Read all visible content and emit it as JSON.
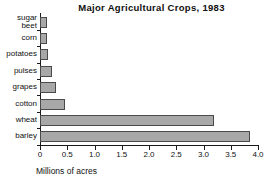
{
  "chart_data": {
    "type": "bar",
    "orientation": "horizontal",
    "title": "Major Agricultural Crops, 1983",
    "xlabel": "Millions of acres",
    "ylabel": "",
    "categories": [
      "sugar\nbeet",
      "corn",
      "potatoes",
      "pulses",
      "grapes",
      "cotton",
      "wheat",
      "barley"
    ],
    "values": [
      0.13,
      0.13,
      0.15,
      0.22,
      0.3,
      0.46,
      3.2,
      3.85
    ],
    "xlim": [
      0,
      4.0
    ],
    "xticks": [
      0,
      0.5,
      1.0,
      1.5,
      2.0,
      2.5,
      3.0,
      3.5,
      4.0
    ],
    "xtick_labels": [
      "0",
      "0.5",
      "1.0",
      "1.5",
      "2.0",
      "2.5",
      "3.0",
      "3.5",
      "4.0"
    ],
    "grid": false,
    "legend": null,
    "bar_fill_color": "#a8a8a8",
    "bar_edge_color": "#4a4a4a",
    "axis_color": "#1a1a1a"
  }
}
